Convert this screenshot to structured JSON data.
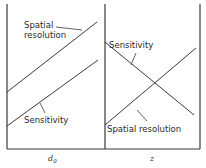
{
  "panels": [
    {
      "x_axis_label": "d",
      "x_axis_subscript": "0",
      "curves": [
        {
          "label_line1": "Spatial",
          "label_line2": "resolution",
          "trend": "increasing"
        },
        {
          "label": "Sensitivity",
          "trend": "increasing"
        }
      ]
    },
    {
      "x_axis_label": "z",
      "curves": [
        {
          "label": "Sensitivity",
          "trend": "decreasing"
        },
        {
          "label": "Spatial resolution",
          "trend": "increasing"
        }
      ]
    }
  ],
  "colors": {
    "line": "#3a3a3a",
    "background": "#ffffff"
  }
}
